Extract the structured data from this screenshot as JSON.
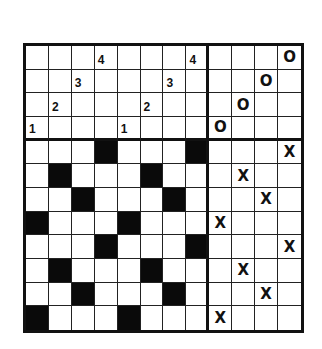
{
  "puzzle": {
    "rows": 12,
    "cols": 12,
    "divider_col_after": 8,
    "divider_row_after": 4,
    "colors": {
      "line": "#111111",
      "black_cell": "#0a0a0a",
      "background": "#ffffff"
    },
    "clues": [
      {
        "row": 0,
        "col": 3,
        "text": "4"
      },
      {
        "row": 0,
        "col": 7,
        "text": "4"
      },
      {
        "row": 1,
        "col": 2,
        "text": "3"
      },
      {
        "row": 1,
        "col": 6,
        "text": "3"
      },
      {
        "row": 2,
        "col": 1,
        "text": "2"
      },
      {
        "row": 2,
        "col": 5,
        "text": "2"
      },
      {
        "row": 3,
        "col": 0,
        "text": "1"
      },
      {
        "row": 3,
        "col": 4,
        "text": "1"
      }
    ],
    "o_marks": [
      {
        "row": 0,
        "col": 11,
        "text": "O"
      },
      {
        "row": 1,
        "col": 10,
        "text": "O"
      },
      {
        "row": 2,
        "col": 9,
        "text": "O"
      },
      {
        "row": 3,
        "col": 8,
        "text": "O"
      }
    ],
    "x_marks": [
      {
        "row": 4,
        "col": 11,
        "text": "X"
      },
      {
        "row": 5,
        "col": 9,
        "text": "X"
      },
      {
        "row": 6,
        "col": 10,
        "text": "X"
      },
      {
        "row": 7,
        "col": 8,
        "text": "X"
      },
      {
        "row": 8,
        "col": 11,
        "text": "X"
      },
      {
        "row": 9,
        "col": 9,
        "text": "X"
      },
      {
        "row": 10,
        "col": 10,
        "text": "X"
      },
      {
        "row": 11,
        "col": 8,
        "text": "X"
      }
    ],
    "black_cells": [
      [
        4,
        3
      ],
      [
        4,
        7
      ],
      [
        5,
        1
      ],
      [
        5,
        5
      ],
      [
        6,
        2
      ],
      [
        6,
        6
      ],
      [
        7,
        0
      ],
      [
        7,
        4
      ],
      [
        8,
        3
      ],
      [
        8,
        7
      ],
      [
        9,
        1
      ],
      [
        9,
        5
      ],
      [
        10,
        2
      ],
      [
        10,
        6
      ],
      [
        11,
        0
      ],
      [
        11,
        4
      ]
    ]
  }
}
